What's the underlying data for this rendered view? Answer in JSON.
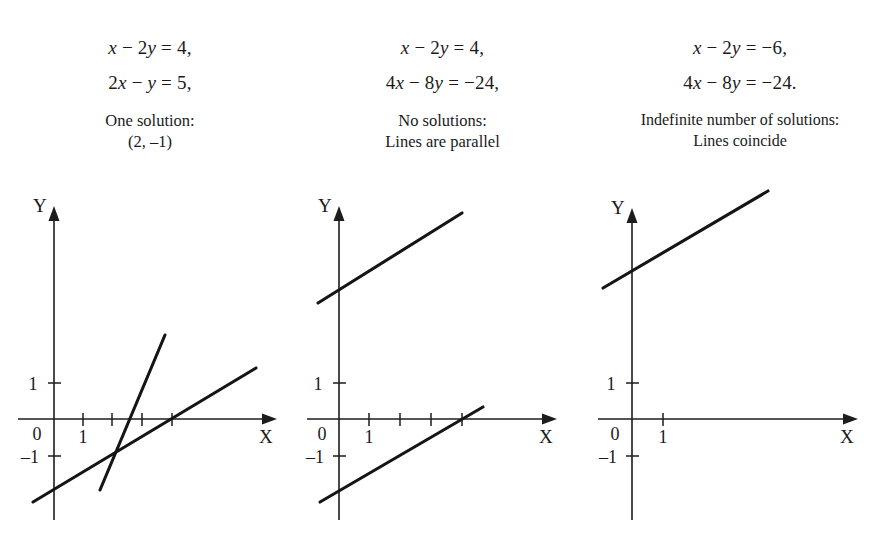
{
  "figure": {
    "background_color": "#ffffff",
    "ink_color": "#1a1a1a",
    "panel_count": 3
  },
  "panels": [
    {
      "id": "panel-one-solution",
      "equations": [
        "x − 2y = 4,",
        "2x − y = 5,"
      ],
      "note_lines": [
        "One solution:",
        "(2, –1)"
      ],
      "axis": {
        "x_label": "X",
        "y_label": "Y",
        "x_ticks": [
          "1"
        ],
        "y_ticks": [
          "1",
          "0",
          "–1"
        ]
      },
      "lines": [
        {
          "name": "line-x-2y-4",
          "equation": "x − 2y = 4",
          "slope": 0.5,
          "intercept": -2
        },
        {
          "name": "line-2x-y-5",
          "equation": "2x − y = 5",
          "slope": 2,
          "intercept": -5
        }
      ],
      "intersection": "(2, –1)"
    },
    {
      "id": "panel-no-solutions",
      "equations": [
        "x − 2y = 4,",
        "4x − 8y = −24,"
      ],
      "note_lines": [
        "No solutions:",
        "Lines are parallel"
      ],
      "axis": {
        "x_label": "X",
        "y_label": "Y",
        "x_ticks": [
          "1"
        ],
        "y_ticks": [
          "1",
          "0",
          "–1"
        ]
      },
      "lines": [
        {
          "name": "line-x-2y-4",
          "equation": "x − 2y = 4",
          "slope": 0.5,
          "intercept": -2
        },
        {
          "name": "line-4x-8y-neg24",
          "equation": "4x − 8y = −24",
          "slope": 0.5,
          "intercept": 3
        }
      ],
      "intersection": null
    },
    {
      "id": "panel-indefinite-solutions",
      "equations": [
        "x − 2y = −6,",
        "4x − 8y = −24."
      ],
      "note_lines": [
        "Indefinite number of solutions:",
        "Lines coincide"
      ],
      "axis": {
        "x_label": "X",
        "y_label": "Y",
        "x_ticks": [
          "1"
        ],
        "y_ticks": [
          "1",
          "0",
          "–1"
        ]
      },
      "lines": [
        {
          "name": "line-coincident",
          "equation": "x − 2y = −6 / 4x − 8y = −24",
          "slope": 0.5,
          "intercept": 3
        }
      ],
      "intersection": "all points on the line"
    }
  ],
  "chart_data": {
    "type": "line",
    "title": "",
    "xlabel": "X",
    "ylabel": "Y",
    "grid": false,
    "legend": "none",
    "subplots": [
      {
        "name": "one-solution",
        "xlim": [
          -1,
          7.5
        ],
        "ylim": [
          -2.5,
          3
        ],
        "series": [
          {
            "name": "x − 2y = 4",
            "slope": 0.5,
            "intercept": -2,
            "points": [
              [
                -0.7,
                -2.35
              ],
              [
                7.0,
                1.5
              ]
            ]
          },
          {
            "name": "2x − y = 5",
            "slope": 2,
            "intercept": -5,
            "points": [
              [
                1.55,
                -1.9
              ],
              [
                3.75,
                2.5
              ]
            ]
          }
        ],
        "annotations": [
          "One solution: (2, –1)"
        ]
      },
      {
        "name": "no-solutions",
        "xlim": [
          -1,
          7.5
        ],
        "ylim": [
          -2.5,
          3
        ],
        "series": [
          {
            "name": "x − 2y = 4",
            "slope": 0.5,
            "intercept": -2,
            "points": [
              [
                -0.65,
                -2.3
              ],
              [
                4.9,
                0.45
              ]
            ]
          },
          {
            "name": "4x − 8y = −24",
            "slope": 0.5,
            "intercept": 3,
            "points": [
              [
                -0.7,
                2.65
              ],
              [
                4.15,
                5.1
              ]
            ]
          }
        ],
        "annotations": [
          "No solutions: Lines are parallel"
        ]
      },
      {
        "name": "indefinite-solutions",
        "xlim": [
          -1,
          7.5
        ],
        "ylim": [
          -2.5,
          3
        ],
        "series": [
          {
            "name": "x − 2y = −6 and 4x − 8y = −24",
            "slope": 0.5,
            "intercept": 3,
            "points": [
              [
                -1.0,
                2.5
              ],
              [
                4.6,
                5.3
              ]
            ]
          }
        ],
        "annotations": [
          "Indefinite number of solutions: Lines coincide"
        ]
      }
    ]
  }
}
